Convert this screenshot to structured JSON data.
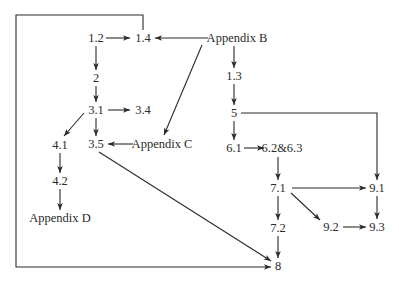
{
  "diagram": {
    "type": "dependency-graph",
    "line_color": "#2a2a2a",
    "background": "#ffffff",
    "nodes": [
      {
        "id": "n12",
        "label": "1.2",
        "x": 96,
        "y": 38
      },
      {
        "id": "n14",
        "label": "1.4",
        "x": 143,
        "y": 38
      },
      {
        "id": "appB",
        "label": "Appendix B",
        "x": 237,
        "y": 38
      },
      {
        "id": "n2",
        "label": "2",
        "x": 96,
        "y": 78
      },
      {
        "id": "n13",
        "label": "1.3",
        "x": 234,
        "y": 76
      },
      {
        "id": "n31",
        "label": "3.1",
        "x": 96,
        "y": 110
      },
      {
        "id": "n34",
        "label": "3.4",
        "x": 143,
        "y": 110
      },
      {
        "id": "n5",
        "label": "5",
        "x": 234,
        "y": 113
      },
      {
        "id": "n41",
        "label": "4.1",
        "x": 60,
        "y": 145
      },
      {
        "id": "n35",
        "label": "3.5",
        "x": 96,
        "y": 144
      },
      {
        "id": "appC",
        "label": "Appendix C",
        "x": 162,
        "y": 144
      },
      {
        "id": "n61",
        "label": "6.1",
        "x": 234,
        "y": 148
      },
      {
        "id": "n6263",
        "label": "6.2&6.3",
        "x": 282,
        "y": 148
      },
      {
        "id": "n42",
        "label": "4.2",
        "x": 60,
        "y": 181
      },
      {
        "id": "n71",
        "label": "7.1",
        "x": 278,
        "y": 188
      },
      {
        "id": "n91",
        "label": "9.1",
        "x": 377,
        "y": 188
      },
      {
        "id": "appD",
        "label": "Appendix D",
        "x": 60,
        "y": 218
      },
      {
        "id": "n72",
        "label": "7.2",
        "x": 278,
        "y": 228
      },
      {
        "id": "n92",
        "label": "9.2",
        "x": 331,
        "y": 227
      },
      {
        "id": "n93",
        "label": "9.3",
        "x": 377,
        "y": 227
      },
      {
        "id": "n8",
        "label": "8",
        "x": 278,
        "y": 266
      }
    ],
    "edges": [
      {
        "from": "1.2",
        "to": "1.4",
        "path": [
          [
            106,
            38
          ],
          [
            130,
            38
          ]
        ]
      },
      {
        "from": "Appendix B",
        "to": "1.4",
        "path": [
          [
            208,
            38
          ],
          [
            155,
            38
          ]
        ]
      },
      {
        "from": "1.2",
        "to": "2",
        "path": [
          [
            96,
            46
          ],
          [
            96,
            70
          ]
        ]
      },
      {
        "from": "2",
        "to": "3.1",
        "path": [
          [
            96,
            86
          ],
          [
            96,
            102
          ]
        ]
      },
      {
        "from": "3.1",
        "to": "3.4",
        "path": [
          [
            108,
            110
          ],
          [
            130,
            110
          ]
        ]
      },
      {
        "from": "3.1",
        "to": "4.1",
        "path": [
          [
            84,
            113
          ],
          [
            64,
            136
          ]
        ]
      },
      {
        "from": "3.1",
        "to": "3.5",
        "path": [
          [
            96,
            118
          ],
          [
            96,
            136
          ]
        ]
      },
      {
        "from": "Appendix B",
        "to": "Appendix C",
        "path": [
          [
            202,
            45
          ],
          [
            164,
            135
          ]
        ]
      },
      {
        "from": "Appendix C",
        "to": "3.5",
        "path": [
          [
            133,
            144
          ],
          [
            108,
            144
          ]
        ]
      },
      {
        "from": "4.1",
        "to": "4.2",
        "path": [
          [
            60,
            153
          ],
          [
            60,
            173
          ]
        ]
      },
      {
        "from": "4.2",
        "to": "Appendix D",
        "path": [
          [
            60,
            189
          ],
          [
            60,
            210
          ]
        ]
      },
      {
        "from": "Appendix B",
        "to": "1.3",
        "path": [
          [
            234,
            46
          ],
          [
            234,
            68
          ]
        ]
      },
      {
        "from": "1.3",
        "to": "5",
        "path": [
          [
            234,
            84
          ],
          [
            234,
            105
          ]
        ]
      },
      {
        "from": "5",
        "to": "6.1",
        "path": [
          [
            234,
            121
          ],
          [
            234,
            140
          ]
        ]
      },
      {
        "from": "5",
        "to": "9.1",
        "path": [
          [
            241,
            113
          ],
          [
            377,
            113
          ],
          [
            377,
            180
          ]
        ]
      },
      {
        "from": "6.1",
        "to": "6.2&6.3",
        "path": [
          [
            244,
            148
          ],
          [
            264,
            148
          ]
        ]
      },
      {
        "from": "6.2&6.3",
        "to": "7.1",
        "path": [
          [
            278,
            157
          ],
          [
            278,
            180
          ]
        ]
      },
      {
        "from": "7.1",
        "to": "9.1",
        "path": [
          [
            292,
            188
          ],
          [
            366,
            188
          ]
        ]
      },
      {
        "from": "7.1",
        "to": "9.2",
        "path": [
          [
            291,
            193
          ],
          [
            320,
            220
          ]
        ]
      },
      {
        "from": "7.1",
        "to": "7.2",
        "path": [
          [
            278,
            196
          ],
          [
            278,
            220
          ]
        ]
      },
      {
        "from": "9.1",
        "to": "9.3",
        "path": [
          [
            377,
            196
          ],
          [
            377,
            219
          ]
        ]
      },
      {
        "from": "9.2",
        "to": "9.3",
        "path": [
          [
            343,
            227
          ],
          [
            366,
            227
          ]
        ]
      },
      {
        "from": "7.2",
        "to": "8",
        "path": [
          [
            278,
            236
          ],
          [
            278,
            258
          ]
        ]
      },
      {
        "from": "3.5",
        "to": "8",
        "path": [
          [
            99,
            152
          ],
          [
            271,
            261
          ]
        ]
      },
      {
        "from": "1.4",
        "to": "8",
        "path": [
          [
            143,
            30
          ],
          [
            143,
            15
          ],
          [
            16,
            15
          ],
          [
            16,
            267
          ],
          [
            271,
            267
          ]
        ]
      }
    ]
  }
}
